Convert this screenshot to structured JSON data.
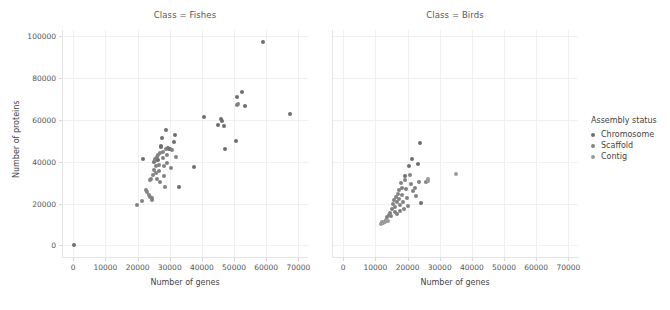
{
  "chart_data": {
    "type": "scatter",
    "title": "",
    "xlabel": "Number of genes",
    "ylabel": "Number of proteins",
    "xlim": [
      -3500,
      73000
    ],
    "ylim": [
      -6000,
      103000
    ],
    "xticks": [
      0,
      10000,
      20000,
      30000,
      40000,
      50000,
      60000,
      70000
    ],
    "xticklabels": [
      "0",
      "10000",
      "20000",
      "30000",
      "40000",
      "50000",
      "60000",
      "70000"
    ],
    "yticks": [
      0,
      20000,
      40000,
      60000,
      80000,
      100000
    ],
    "yticklabels": [
      "0",
      "20000",
      "40000",
      "60000",
      "80000",
      "100000"
    ],
    "grid": true,
    "legend_position": "right",
    "facet_variable": "Class",
    "legend": {
      "title": "Assembly status",
      "entries": [
        {
          "label": "Chromosome",
          "color": "#6e6e6e",
          "key": "chromosome"
        },
        {
          "label": "Scaffold",
          "color": "#828282",
          "key": "scaffold"
        },
        {
          "label": "Contig",
          "color": "#9a9a9a",
          "key": "contig"
        }
      ]
    },
    "facets": [
      {
        "title": "Class = Fishes",
        "name": "fishes",
        "points": [
          {
            "x": 300,
            "y": 400,
            "status": "chromosome"
          },
          {
            "x": 19700,
            "y": 19300,
            "status": "scaffold"
          },
          {
            "x": 21300,
            "y": 21400,
            "status": "scaffold"
          },
          {
            "x": 21600,
            "y": 41500,
            "status": "chromosome"
          },
          {
            "x": 22600,
            "y": 26500,
            "status": "scaffold"
          },
          {
            "x": 22900,
            "y": 25700,
            "status": "scaffold"
          },
          {
            "x": 23500,
            "y": 24300,
            "status": "scaffold"
          },
          {
            "x": 23800,
            "y": 31300,
            "status": "scaffold"
          },
          {
            "x": 23900,
            "y": 23400,
            "status": "scaffold"
          },
          {
            "x": 24200,
            "y": 31700,
            "status": "scaffold"
          },
          {
            "x": 24400,
            "y": 22600,
            "status": "scaffold"
          },
          {
            "x": 24600,
            "y": 21600,
            "status": "scaffold"
          },
          {
            "x": 24800,
            "y": 33900,
            "status": "scaffold"
          },
          {
            "x": 25000,
            "y": 36300,
            "status": "scaffold"
          },
          {
            "x": 25100,
            "y": 39700,
            "status": "chromosome"
          },
          {
            "x": 25300,
            "y": 40600,
            "status": "scaffold"
          },
          {
            "x": 25400,
            "y": 41200,
            "status": "scaffold"
          },
          {
            "x": 25600,
            "y": 37900,
            "status": "scaffold"
          },
          {
            "x": 25700,
            "y": 34600,
            "status": "scaffold"
          },
          {
            "x": 25900,
            "y": 31900,
            "status": "scaffold"
          },
          {
            "x": 26100,
            "y": 42200,
            "status": "scaffold"
          },
          {
            "x": 26300,
            "y": 40900,
            "status": "chromosome"
          },
          {
            "x": 26400,
            "y": 43300,
            "status": "scaffold"
          },
          {
            "x": 26600,
            "y": 38600,
            "status": "scaffold"
          },
          {
            "x": 26800,
            "y": 35400,
            "status": "scaffold"
          },
          {
            "x": 26900,
            "y": 30400,
            "status": "scaffold"
          },
          {
            "x": 27100,
            "y": 44100,
            "status": "scaffold"
          },
          {
            "x": 27300,
            "y": 46900,
            "status": "chromosome"
          },
          {
            "x": 27400,
            "y": 47700,
            "status": "chromosome"
          },
          {
            "x": 27600,
            "y": 51400,
            "status": "chromosome"
          },
          {
            "x": 27800,
            "y": 44700,
            "status": "scaffold"
          },
          {
            "x": 27900,
            "y": 41900,
            "status": "scaffold"
          },
          {
            "x": 28100,
            "y": 38000,
            "status": "scaffold"
          },
          {
            "x": 28300,
            "y": 33400,
            "status": "scaffold"
          },
          {
            "x": 28500,
            "y": 28000,
            "status": "scaffold"
          },
          {
            "x": 28700,
            "y": 55300,
            "status": "chromosome"
          },
          {
            "x": 28900,
            "y": 46300,
            "status": "scaffold"
          },
          {
            "x": 29100,
            "y": 43100,
            "status": "scaffold"
          },
          {
            "x": 29300,
            "y": 39300,
            "status": "scaffold"
          },
          {
            "x": 29600,
            "y": 46600,
            "status": "chromosome"
          },
          {
            "x": 29900,
            "y": 45900,
            "status": "scaffold"
          },
          {
            "x": 30200,
            "y": 46200,
            "status": "chromosome"
          },
          {
            "x": 30500,
            "y": 36800,
            "status": "scaffold"
          },
          {
            "x": 30800,
            "y": 45400,
            "status": "scaffold"
          },
          {
            "x": 31200,
            "y": 49400,
            "status": "chromosome"
          },
          {
            "x": 31500,
            "y": 52600,
            "status": "chromosome"
          },
          {
            "x": 31800,
            "y": 42400,
            "status": "scaffold"
          },
          {
            "x": 32900,
            "y": 28100,
            "status": "chromosome"
          },
          {
            "x": 37600,
            "y": 37600,
            "status": "chromosome"
          },
          {
            "x": 40700,
            "y": 61400,
            "status": "chromosome"
          },
          {
            "x": 44900,
            "y": 57700,
            "status": "chromosome"
          },
          {
            "x": 45900,
            "y": 60400,
            "status": "chromosome"
          },
          {
            "x": 46200,
            "y": 59700,
            "status": "chromosome"
          },
          {
            "x": 46900,
            "y": 57200,
            "status": "chromosome"
          },
          {
            "x": 47100,
            "y": 46300,
            "status": "chromosome"
          },
          {
            "x": 50600,
            "y": 50100,
            "status": "chromosome"
          },
          {
            "x": 50900,
            "y": 71000,
            "status": "chromosome"
          },
          {
            "x": 51000,
            "y": 67200,
            "status": "scaffold"
          },
          {
            "x": 51300,
            "y": 67600,
            "status": "scaffold"
          },
          {
            "x": 52600,
            "y": 73200,
            "status": "chromosome"
          },
          {
            "x": 53400,
            "y": 66700,
            "status": "chromosome"
          },
          {
            "x": 59100,
            "y": 97500,
            "status": "chromosome"
          },
          {
            "x": 67300,
            "y": 62700,
            "status": "chromosome"
          }
        ]
      },
      {
        "title": "Class = Birds",
        "name": "birds",
        "points": [
          {
            "x": 11600,
            "y": 10200,
            "status": "contig"
          },
          {
            "x": 11900,
            "y": 10600,
            "status": "contig"
          },
          {
            "x": 12200,
            "y": 11000,
            "status": "contig"
          },
          {
            "x": 12500,
            "y": 10800,
            "status": "contig"
          },
          {
            "x": 12800,
            "y": 11400,
            "status": "contig"
          },
          {
            "x": 13100,
            "y": 11200,
            "status": "contig"
          },
          {
            "x": 13400,
            "y": 12300,
            "status": "contig"
          },
          {
            "x": 13700,
            "y": 13600,
            "status": "scaffold"
          },
          {
            "x": 14000,
            "y": 11800,
            "status": "contig"
          },
          {
            "x": 14300,
            "y": 14500,
            "status": "scaffold"
          },
          {
            "x": 14600,
            "y": 15300,
            "status": "scaffold"
          },
          {
            "x": 14900,
            "y": 13900,
            "status": "scaffold"
          },
          {
            "x": 15200,
            "y": 17600,
            "status": "scaffold"
          },
          {
            "x": 15500,
            "y": 19700,
            "status": "scaffold"
          },
          {
            "x": 15700,
            "y": 21700,
            "status": "scaffold"
          },
          {
            "x": 16000,
            "y": 18300,
            "status": "scaffold"
          },
          {
            "x": 16200,
            "y": 16100,
            "status": "scaffold"
          },
          {
            "x": 16400,
            "y": 23400,
            "status": "scaffold"
          },
          {
            "x": 16600,
            "y": 20600,
            "status": "scaffold"
          },
          {
            "x": 16800,
            "y": 14800,
            "status": "scaffold"
          },
          {
            "x": 17000,
            "y": 24500,
            "status": "scaffold"
          },
          {
            "x": 17200,
            "y": 26400,
            "status": "scaffold"
          },
          {
            "x": 17400,
            "y": 22300,
            "status": "scaffold"
          },
          {
            "x": 17600,
            "y": 19100,
            "status": "scaffold"
          },
          {
            "x": 17800,
            "y": 16700,
            "status": "scaffold"
          },
          {
            "x": 18000,
            "y": 29900,
            "status": "scaffold"
          },
          {
            "x": 18200,
            "y": 27600,
            "status": "scaffold"
          },
          {
            "x": 18400,
            "y": 24000,
            "status": "scaffold"
          },
          {
            "x": 18700,
            "y": 21000,
            "status": "scaffold"
          },
          {
            "x": 18900,
            "y": 17400,
            "status": "scaffold"
          },
          {
            "x": 19100,
            "y": 33400,
            "status": "chromosome"
          },
          {
            "x": 19300,
            "y": 31100,
            "status": "scaffold"
          },
          {
            "x": 19600,
            "y": 26900,
            "status": "scaffold"
          },
          {
            "x": 19900,
            "y": 22800,
            "status": "scaffold"
          },
          {
            "x": 20200,
            "y": 18900,
            "status": "scaffold"
          },
          {
            "x": 20500,
            "y": 38200,
            "status": "chromosome"
          },
          {
            "x": 20800,
            "y": 33800,
            "status": "scaffold"
          },
          {
            "x": 21100,
            "y": 29400,
            "status": "scaffold"
          },
          {
            "x": 21400,
            "y": 41400,
            "status": "chromosome"
          },
          {
            "x": 21700,
            "y": 26200,
            "status": "scaffold"
          },
          {
            "x": 22200,
            "y": 27400,
            "status": "scaffold"
          },
          {
            "x": 22600,
            "y": 23700,
            "status": "scaffold"
          },
          {
            "x": 23100,
            "y": 38700,
            "status": "chromosome"
          },
          {
            "x": 23400,
            "y": 30100,
            "status": "scaffold"
          },
          {
            "x": 23900,
            "y": 48900,
            "status": "chromosome"
          },
          {
            "x": 24200,
            "y": 20400,
            "status": "chromosome"
          },
          {
            "x": 25600,
            "y": 30200,
            "status": "scaffold"
          },
          {
            "x": 26400,
            "y": 31600,
            "status": "contig"
          },
          {
            "x": 26500,
            "y": 30700,
            "status": "contig"
          },
          {
            "x": 35100,
            "y": 34200,
            "status": "contig"
          }
        ]
      }
    ]
  }
}
